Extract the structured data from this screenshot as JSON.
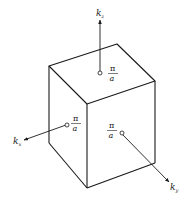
{
  "diagram": {
    "type": "brillouin-zone-cube",
    "colors": {
      "stroke": "#1a1a1a",
      "background": "#ffffff"
    },
    "axes": [
      {
        "id": "kz",
        "label": "k",
        "subscript": "z",
        "direction": "up"
      },
      {
        "id": "kx",
        "label": "k",
        "subscript": "x",
        "direction": "left-down"
      },
      {
        "id": "ky",
        "label": "k",
        "subscript": "y",
        "direction": "right-down"
      }
    ],
    "face_labels": [
      {
        "face": "top",
        "numerator": "π",
        "denominator": "a"
      },
      {
        "face": "left",
        "numerator": "π",
        "denominator": "a"
      },
      {
        "face": "front",
        "numerator": "π",
        "denominator": "a"
      }
    ]
  }
}
